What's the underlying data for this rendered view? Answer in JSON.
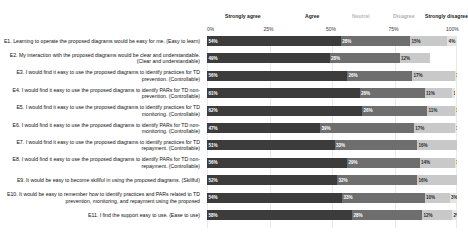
{
  "chart_data": {
    "type": "bar",
    "orientation": "horizontal-stacked",
    "title": "",
    "xlabel": "",
    "ylabel": "",
    "xlim": [
      0,
      100
    ],
    "grid": true,
    "legend_position": "top",
    "axis_ticks": [
      "0%",
      "25%",
      "50%",
      "75%",
      "100%"
    ],
    "legend": [
      "Strongly agree",
      "Agree",
      "Neutral",
      "Disagree",
      "Strongly disagree"
    ],
    "colors": [
      "#3c3c3c",
      "#6e6e6e",
      "#9a9a9a",
      "#c9c9c9",
      "#e4e4e4"
    ],
    "categories": [
      "E1. Learning to operate the proposed diagrams would be easy for me. (Easy to learn)",
      "E2. My interaction with the proposed diagrams would be clear and understandable. (Clear and understandable)",
      "E3. I would find it easy to use the proposed diagrams to identify practices for TD prevention. (Controllable)",
      "E4. I would find it easy to use the proposed diagrams to identify PARs for TD non-prevention. (Controllable)",
      "E5. I would find it easy to use the proposed diagrams to identify practices for TD monitoring. (Controllable)",
      "E6. I would find it easy to use the proposed diagrams to identify PARs for TD non-monitoring. (Controllable)",
      "E7. I would find it easy to use the proposed diagrams to identify practices for TD repayment. (Controllable)",
      "E8. I would find it easy to use the proposed diagrams to identify PARs for TD non-repayment. (Controllable)",
      "E9. It would be easy to become skillful in using the proposed diagrams. (Skillful)",
      "E10. It would be easy to remember how to identify practices and PARs related to TD prevention, monitoring, and repayment using the proposed",
      "E11. I find the support easy to use. (Ease to use)"
    ],
    "series": [
      {
        "name": "Strongly agree",
        "values": [
          54,
          49,
          56,
          61,
          62,
          47,
          51,
          56,
          52,
          54,
          58
        ]
      },
      {
        "name": "Agree",
        "values": [
          28,
          28,
          26,
          26,
          26,
          39,
          33,
          29,
          32,
          33,
          28
        ]
      },
      {
        "name": "Neutral",
        "values": [
          0,
          0,
          0,
          0,
          0,
          0,
          0,
          0,
          0,
          0,
          0
        ]
      },
      {
        "name": "Disagree",
        "values": [
          15,
          12,
          17,
          11,
          11,
          17,
          16,
          14,
          16,
          10,
          12
        ]
      },
      {
        "name": "Strongly disagree",
        "values": [
          4,
          0,
          1,
          1,
          1,
          1,
          0,
          1,
          0,
          3,
          2
        ]
      }
    ],
    "bar_labels": [
      [
        "54%",
        "28%",
        "",
        "15%",
        "4%"
      ],
      [
        "49%",
        "28%",
        "",
        "12%",
        ""
      ],
      [
        "56%",
        "26%",
        "",
        "17%",
        "1%"
      ],
      [
        "61%",
        "26%",
        "",
        "11%",
        "1%"
      ],
      [
        "62%",
        "26%",
        "",
        "11%",
        "1%"
      ],
      [
        "47%",
        "39%",
        "",
        "17%",
        "1%"
      ],
      [
        "51%",
        "33%",
        "",
        "16%",
        ""
      ],
      [
        "56%",
        "29%",
        "",
        "14%",
        "1%"
      ],
      [
        "52%",
        "32%",
        "",
        "16%",
        ""
      ],
      [
        "54%",
        "33%",
        "",
        "10%",
        "3%"
      ],
      [
        "58%",
        "28%",
        "",
        "12%",
        "2%"
      ]
    ]
  }
}
